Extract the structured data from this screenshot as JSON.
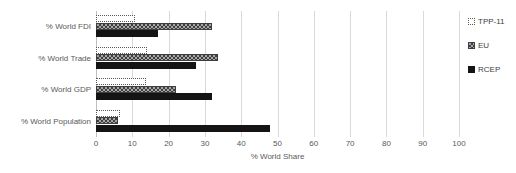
{
  "chart_data": {
    "type": "bar",
    "orientation": "horizontal",
    "title": "",
    "xlabel": "% World Share",
    "ylabel": "",
    "xlim": [
      0,
      100
    ],
    "xticks": [
      0,
      10,
      20,
      30,
      40,
      50,
      60,
      70,
      80,
      90,
      100
    ],
    "grid": "vertical",
    "legend_position": "right",
    "categories": [
      "% World FDI",
      "% World Trade",
      "% World GDP",
      "% World Population"
    ],
    "series": [
      {
        "name": "TPP-11",
        "color": "#ffffff",
        "pattern": "open-dotted-outline",
        "values": [
          10.7,
          14.0,
          13.8,
          6.5
        ]
      },
      {
        "name": "EU",
        "color": "#a6a6a6",
        "pattern": "checkerboard",
        "values": [
          32.0,
          33.5,
          22.0,
          6.0
        ]
      },
      {
        "name": "RCEP",
        "color": "#141414",
        "pattern": "solid",
        "values": [
          17.0,
          27.5,
          32.0,
          48.0
        ]
      }
    ]
  },
  "axis": {
    "x_title": "% World Share",
    "tick_labels": [
      "0",
      "10",
      "20",
      "30",
      "40",
      "50",
      "60",
      "70",
      "80",
      "90",
      "100"
    ]
  },
  "legend": {
    "items": [
      {
        "label": "TPP-11"
      },
      {
        "label": "EU"
      },
      {
        "label": "RCEP"
      }
    ]
  },
  "colors": {
    "grid": "#d9d9d9",
    "text": "#595959",
    "tpp11": "#ffffff",
    "eu": "#a6a6a6",
    "rcep": "#141414"
  }
}
